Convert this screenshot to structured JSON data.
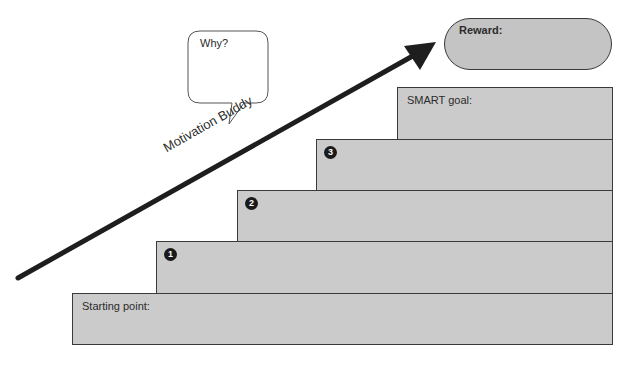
{
  "diagram": {
    "type": "staircase-goal-plan",
    "colors": {
      "step_fill": "#cbcbcb",
      "reward_fill": "#c4c4c4",
      "outline": "#3a3a3a",
      "arrow": "#1e1e1e"
    },
    "speech_bubble": {
      "text": "Why?"
    },
    "arrow": {
      "label": "Motivation Buddy"
    },
    "reward": {
      "label": "Reward:"
    },
    "steps": [
      {
        "label": "Starting point:"
      },
      {
        "number": "1"
      },
      {
        "number": "2"
      },
      {
        "number": "3"
      },
      {
        "label": "SMART goal:"
      }
    ]
  }
}
